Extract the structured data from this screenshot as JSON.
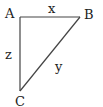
{
  "diagram": {
    "type": "right-triangle",
    "vertices": [
      {
        "label": "A",
        "x": 20,
        "y": 17
      },
      {
        "label": "B",
        "x": 80,
        "y": 17
      },
      {
        "label": "C",
        "x": 20,
        "y": 91
      }
    ],
    "sides": [
      {
        "label": "x",
        "from": "A",
        "to": "B"
      },
      {
        "label": "y",
        "from": "B",
        "to": "C"
      },
      {
        "label": "z",
        "from": "A",
        "to": "C"
      }
    ],
    "line_color": "#444444"
  },
  "labels": {
    "vertex_a": "A",
    "vertex_b": "B",
    "vertex_c": "C",
    "side_x": "x",
    "side_y": "y",
    "side_z": "z"
  }
}
